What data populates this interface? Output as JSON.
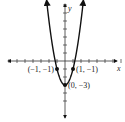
{
  "chart_data": {
    "type": "line",
    "title": "",
    "xlabel": "x",
    "ylabel": "y",
    "xlim": [
      -7,
      7
    ],
    "ylim": [
      -5,
      7
    ],
    "x_ticks": [
      -7,
      -6,
      -5,
      -4,
      -3,
      -2,
      -1,
      1,
      2,
      3,
      4,
      5,
      6,
      7
    ],
    "y_ticks": [
      -5,
      -4,
      -3,
      -2,
      -1,
      1,
      2,
      3,
      4,
      5,
      6,
      7
    ],
    "grid": false,
    "series": [
      {
        "name": "y = 2x^2 - 3",
        "equation": "y = 2x^2 - 3",
        "x": [
          -2.3,
          -2,
          -1.5,
          -1,
          -0.5,
          0,
          0.5,
          1,
          1.5,
          2,
          2.3
        ],
        "y": [
          7.58,
          5,
          1.5,
          -1,
          -2.5,
          -3,
          -2.5,
          -1,
          1.5,
          5,
          7.58
        ],
        "color": "#111111",
        "arrows_at_ends": true
      }
    ],
    "points": [
      {
        "x": -1,
        "y": -1,
        "label": "(−1, −1)",
        "label_side": "left"
      },
      {
        "x": 1,
        "y": -1,
        "label": "(1, −1)",
        "label_side": "right"
      },
      {
        "x": 0,
        "y": -3,
        "label": "(0, −3)",
        "label_side": "right"
      }
    ]
  }
}
